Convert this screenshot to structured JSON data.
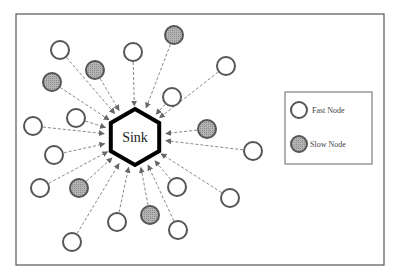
{
  "diagram": {
    "sink": {
      "label": "Sink",
      "cx": 135,
      "cy": 137,
      "r": 28
    },
    "colors": {
      "border": "#555555",
      "node_stroke": "#555555",
      "slow_fill": "#a8a8a8",
      "edge": "#888888",
      "sink_stroke": "#000000"
    },
    "nodes": [
      {
        "x": 60,
        "y": 50,
        "type": "fast"
      },
      {
        "x": 95,
        "y": 70,
        "type": "slow"
      },
      {
        "x": 52,
        "y": 82,
        "type": "slow"
      },
      {
        "x": 133,
        "y": 52,
        "type": "fast"
      },
      {
        "x": 174,
        "y": 35,
        "type": "slow"
      },
      {
        "x": 226,
        "y": 66,
        "type": "fast"
      },
      {
        "x": 172,
        "y": 97,
        "type": "fast"
      },
      {
        "x": 76,
        "y": 118,
        "type": "fast"
      },
      {
        "x": 33,
        "y": 126,
        "type": "fast"
      },
      {
        "x": 207,
        "y": 129,
        "type": "slow"
      },
      {
        "x": 253,
        "y": 151,
        "type": "fast"
      },
      {
        "x": 54,
        "y": 155,
        "type": "fast"
      },
      {
        "x": 40,
        "y": 188,
        "type": "fast"
      },
      {
        "x": 79,
        "y": 188,
        "type": "slow"
      },
      {
        "x": 177,
        "y": 187,
        "type": "fast"
      },
      {
        "x": 230,
        "y": 198,
        "type": "fast"
      },
      {
        "x": 117,
        "y": 222,
        "type": "fast"
      },
      {
        "x": 150,
        "y": 215,
        "type": "slow"
      },
      {
        "x": 178,
        "y": 230,
        "type": "fast"
      },
      {
        "x": 72,
        "y": 242,
        "type": "fast"
      }
    ],
    "legend": {
      "items": [
        {
          "label": "Fast Node",
          "type": "fast"
        },
        {
          "label": "Slow Node",
          "type": "slow"
        }
      ]
    }
  }
}
